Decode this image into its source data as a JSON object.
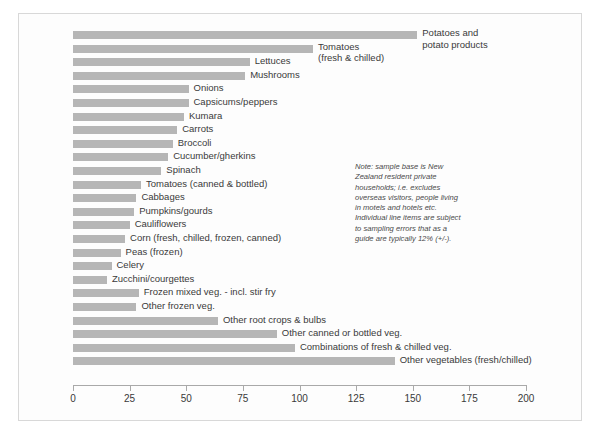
{
  "chart_data": {
    "type": "bar",
    "orientation": "horizontal",
    "title": "",
    "xlabel": "",
    "ylabel": "",
    "xlim": [
      0,
      200
    ],
    "grid": false,
    "legend": null,
    "ticks": [
      0,
      25,
      50,
      75,
      100,
      125,
      150,
      175,
      200
    ],
    "bar_color": "#b6b6b6",
    "categories": [
      "Potatoes and potato products",
      "Tomatoes (fresh & chilled)",
      "Lettuces",
      "Mushrooms",
      "Onions",
      "Capsicums/peppers",
      "Kumara",
      "Carrots",
      "Broccoli",
      "Cucumber/gherkins",
      "Spinach",
      "Tomatoes (canned & bottled)",
      "Cabbages",
      "Pumpkins/gourds",
      "Cauliflowers",
      "Corn (fresh, chilled, frozen, canned)",
      "Peas (frozen)",
      "Celery",
      "Zucchini/courgettes",
      "Frozen mixed veg. - incl. stir fry",
      "Other frozen veg.",
      "Other root crops & bulbs",
      "Other canned or bottled veg.",
      "Combinations of fresh & chilled veg.",
      "Other vegetables (fresh/chilled)"
    ],
    "values": [
      152,
      106,
      78,
      76,
      51,
      51,
      49,
      46,
      44,
      42,
      39,
      30,
      28,
      27,
      25,
      23,
      21,
      17,
      15,
      29,
      28,
      64,
      90,
      98,
      142
    ]
  },
  "labels": [
    {
      "text1": "Potatoes and",
      "text2": "potato products",
      "value": 152
    },
    {
      "text1": "Tomatoes",
      "text2": "(fresh & chilled)",
      "value": 106
    },
    {
      "text1": "Lettuces",
      "text2": "",
      "value": 78
    },
    {
      "text1": "Mushrooms",
      "text2": "",
      "value": 76
    },
    {
      "text1": "Onions",
      "text2": "",
      "value": 51
    },
    {
      "text1": "Capsicums/peppers",
      "text2": "",
      "value": 51
    },
    {
      "text1": "Kumara",
      "text2": "",
      "value": 49
    },
    {
      "text1": "Carrots",
      "text2": "",
      "value": 46
    },
    {
      "text1": "Broccoli",
      "text2": "",
      "value": 44
    },
    {
      "text1": "Cucumber/gherkins",
      "text2": "",
      "value": 42
    },
    {
      "text1": "Spinach",
      "text2": "",
      "value": 39
    },
    {
      "text1": "Tomatoes (canned & bottled)",
      "text2": "",
      "value": 30
    },
    {
      "text1": "Cabbages",
      "text2": "",
      "value": 28
    },
    {
      "text1": "Pumpkins/gourds",
      "text2": "",
      "value": 27
    },
    {
      "text1": "Cauliflowers",
      "text2": "",
      "value": 25
    },
    {
      "text1": "Corn (fresh, chilled, frozen, canned)",
      "text2": "",
      "value": 23
    },
    {
      "text1": "Peas (frozen)",
      "text2": "",
      "value": 21
    },
    {
      "text1": "Celery",
      "text2": "",
      "value": 17
    },
    {
      "text1": "Zucchini/courgettes",
      "text2": "",
      "value": 15
    },
    {
      "text1": "Frozen mixed veg. - incl. stir fry",
      "text2": "",
      "value": 29
    },
    {
      "text1": "Other frozen veg.",
      "text2": "",
      "value": 28
    },
    {
      "text1": "Other root crops & bulbs",
      "text2": "",
      "value": 64
    },
    {
      "text1": "Other canned or bottled veg.",
      "text2": "",
      "value": 90
    },
    {
      "text1": "Combinations of fresh & chilled veg.",
      "text2": "",
      "value": 98
    },
    {
      "text1": "Other vegetables (fresh/chilled)",
      "text2": "",
      "value": 142
    }
  ],
  "axis": {
    "tick_labels": [
      "0",
      "25",
      "50",
      "75",
      "100",
      "125",
      "150",
      "175",
      "200"
    ]
  },
  "note": {
    "text": "Note: sample base is New Zealand resident private households; i.e. excludes overseas visitors, people living in motels and hotels etc. Individual line items are subject to sampling errors that as a guide are typically 12% (+/-)."
  }
}
